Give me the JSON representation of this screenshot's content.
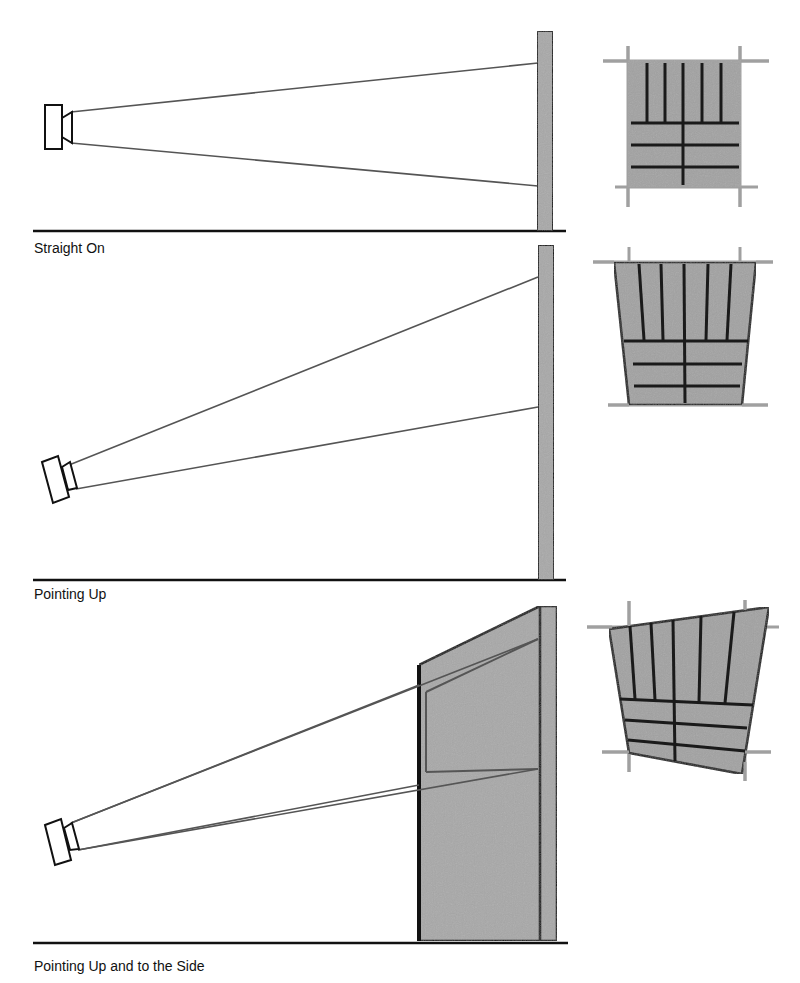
{
  "panels": [
    {
      "id": "straight-on",
      "caption": "Straight On"
    },
    {
      "id": "pointing-up",
      "caption": "Pointing Up"
    },
    {
      "id": "pointing-up-side",
      "caption": "Pointing Up and to the Side"
    }
  ],
  "colors": {
    "surface_fill": "#a8a8a8",
    "outline": "#111111",
    "beam": "#555555",
    "guide": "#a0a0a0",
    "background": "#ffffff"
  },
  "icons": {
    "projector": "projector-icon",
    "screen": "projection-screen",
    "projected_image": "projected-image-panel"
  }
}
